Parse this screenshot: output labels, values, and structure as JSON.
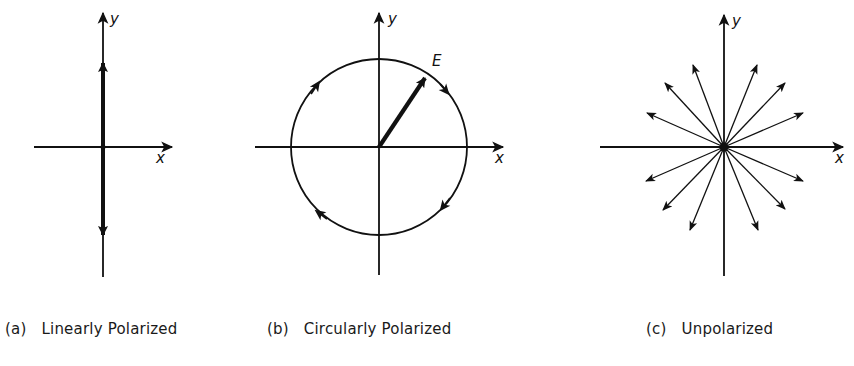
{
  "figure": {
    "panels": [
      {
        "id": "a",
        "tag": "(a)",
        "caption": "Linearly Polarized",
        "x_label": "x",
        "y_label": "y",
        "vector_label": "",
        "description": "Electric field oscillates along the y axis only (double-headed vertical vector)"
      },
      {
        "id": "b",
        "tag": "(b)",
        "caption": "Circularly Polarized",
        "x_label": "x",
        "y_label": "y",
        "vector_label": "E",
        "description": "Field vector E of constant magnitude rotating clockwise around a circle"
      },
      {
        "id": "c",
        "tag": "(c)",
        "caption": "Unpolarized",
        "x_label": "x",
        "y_label": "y",
        "vector_label": "",
        "description": "Field vectors in many random directions radiating from origin"
      }
    ],
    "colors": {
      "ink": "#111111",
      "background": "#ffffff"
    }
  }
}
